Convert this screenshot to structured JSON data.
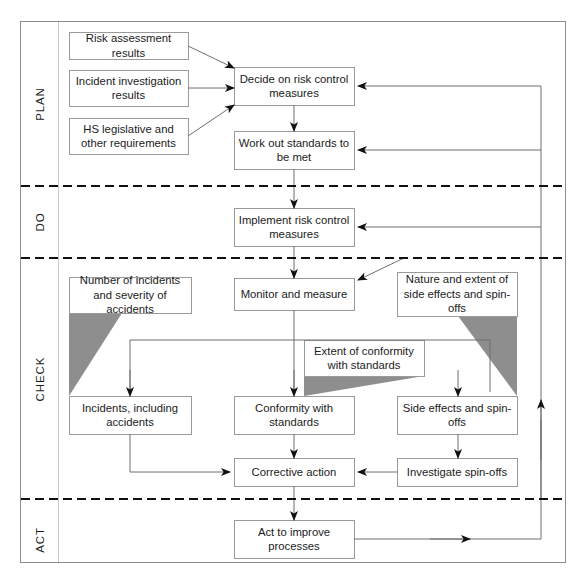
{
  "diagram": {
    "frame": {
      "border_color": "#8c8c8c",
      "background": "#ffffff"
    },
    "colors": {
      "box_border": "#9a9a9a",
      "line": "#6f6f6f",
      "arrow_fill": "#111111",
      "divider": "#111111",
      "triangle_fill": "#8e8e8e",
      "text": "#1b1b1b"
    },
    "phases": [
      {
        "id": "plan",
        "label": "PLAN"
      },
      {
        "id": "do",
        "label": "DO"
      },
      {
        "id": "check",
        "label": "CHECK"
      },
      {
        "id": "act",
        "label": "ACT"
      }
    ],
    "boxes": [
      {
        "id": "risk-assessment-results",
        "label": "Risk assessment results",
        "x": 69,
        "y": 32,
        "w": 119,
        "h": 27
      },
      {
        "id": "incident-investigation",
        "label": "Incident investigation results",
        "x": 69,
        "y": 70,
        "w": 119,
        "h": 36
      },
      {
        "id": "hs-legislative",
        "label": "HS legislative and other requirements",
        "x": 69,
        "y": 118,
        "w": 119,
        "h": 36
      },
      {
        "id": "decide-risk-control",
        "label": "Decide on risk control measures",
        "x": 234,
        "y": 67,
        "w": 120,
        "h": 38
      },
      {
        "id": "work-out-standards",
        "label": "Work out standards to be met",
        "x": 234,
        "y": 131,
        "w": 120,
        "h": 38
      },
      {
        "id": "implement-risk-control",
        "label": "Implement risk control measures",
        "x": 234,
        "y": 208,
        "w": 120,
        "h": 38
      },
      {
        "id": "monitor-and-measure",
        "label": "Monitor and measure",
        "x": 234,
        "y": 278,
        "w": 120,
        "h": 32
      },
      {
        "id": "number-of-incidents",
        "label": "Number of incidents and severity of accidents",
        "x": 69,
        "y": 277,
        "w": 122,
        "h": 36
      },
      {
        "id": "nature-and-extent",
        "label": "Nature and extent of side effects and spin-offs",
        "x": 397,
        "y": 272,
        "w": 120,
        "h": 44
      },
      {
        "id": "extent-of-conformity",
        "label": "Extent of conformity with standards",
        "x": 304,
        "y": 340,
        "w": 120,
        "h": 36
      },
      {
        "id": "incidents-including-accidents",
        "label": "Incidents, including accidents",
        "x": 69,
        "y": 396,
        "w": 122,
        "h": 38
      },
      {
        "id": "conformity-with-standards",
        "label": "Conformity with standards",
        "x": 234,
        "y": 396,
        "w": 120,
        "h": 38
      },
      {
        "id": "side-effects-and-spin-offs",
        "label": "Side effects and spin-offs",
        "x": 397,
        "y": 396,
        "w": 120,
        "h": 38
      },
      {
        "id": "corrective-action",
        "label": "Corrective action",
        "x": 234,
        "y": 458,
        "w": 120,
        "h": 28
      },
      {
        "id": "investigate-spin-offs",
        "label": "Investigate spin-offs",
        "x": 397,
        "y": 458,
        "w": 120,
        "h": 28
      },
      {
        "id": "act-to-improve",
        "label": "Act to improve processes",
        "x": 234,
        "y": 520,
        "w": 120,
        "h": 38
      }
    ],
    "dividers": [
      {
        "id": "plan-do-divider",
        "y": 186
      },
      {
        "id": "do-check-divider",
        "y": 258
      },
      {
        "id": "check-act-divider",
        "y": 499
      }
    ],
    "shaded_triangles": [
      {
        "id": "incidents-shade",
        "points": "69,313 122,313 69,396"
      },
      {
        "id": "conformity-shade",
        "points": "304,376 424,376 304,396"
      },
      {
        "id": "side-effects-shade",
        "points": "458,316 517,316 517,396"
      }
    ]
  }
}
